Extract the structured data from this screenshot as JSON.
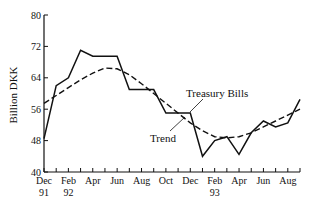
{
  "chart_data": {
    "type": "line",
    "title": "",
    "xlabel": "",
    "ylabel": "Billion DKK",
    "ylim": [
      40,
      80
    ],
    "yticks": [
      40,
      48,
      56,
      64,
      72,
      80
    ],
    "x": [
      "Dec 91",
      "Jan 92",
      "Feb 92",
      "Mar 92",
      "Apr 92",
      "May 92",
      "Jun 92",
      "Jul 92",
      "Aug 92",
      "Sep 92",
      "Oct 92",
      "Nov 92",
      "Dec 92",
      "Jan 93",
      "Feb 93",
      "Mar 93",
      "Apr 93",
      "May 93",
      "Jun 93",
      "Jul 93",
      "Aug 93",
      "Sep 93"
    ],
    "xtick_labels": [
      {
        "month": "Dec",
        "year": "91",
        "index": 0
      },
      {
        "month": "Feb",
        "year": "92",
        "index": 2
      },
      {
        "month": "Apr",
        "year": "",
        "index": 4
      },
      {
        "month": "Jun",
        "year": "",
        "index": 6
      },
      {
        "month": "Aug",
        "year": "",
        "index": 8
      },
      {
        "month": "Oct",
        "year": "",
        "index": 10
      },
      {
        "month": "Dec",
        "year": "",
        "index": 12
      },
      {
        "month": "Feb",
        "year": "93",
        "index": 14
      },
      {
        "month": "Apr",
        "year": "",
        "index": 16
      },
      {
        "month": "Jun",
        "year": "",
        "index": 18
      },
      {
        "month": "Aug",
        "year": "",
        "index": 20
      }
    ],
    "series": [
      {
        "name": "Treasury Bills",
        "style": "solid",
        "values": [
          48.5,
          62,
          64,
          71,
          69.5,
          69.5,
          69.5,
          61,
          61,
          61,
          55,
          55,
          55,
          44,
          48,
          49,
          44.5,
          50,
          53,
          51.5,
          52.5,
          58.5
        ]
      },
      {
        "name": "Trend",
        "style": "dashed",
        "values": [
          57.5,
          59.5,
          61.5,
          63.5,
          65.2,
          66.5,
          66.3,
          64.8,
          62.5,
          60,
          57.5,
          55,
          52.5,
          50.5,
          49,
          48.7,
          49,
          50,
          51.5,
          53,
          54.5,
          56
        ]
      }
    ],
    "annotations": [
      {
        "text": "Treasury Bills",
        "target_series": "Treasury Bills"
      },
      {
        "text": "Trend",
        "target_series": "Trend"
      }
    ],
    "grid": false,
    "legend": "inline annotations"
  }
}
